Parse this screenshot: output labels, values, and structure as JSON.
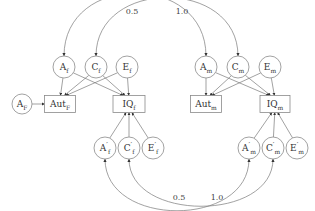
{
  "diagram": {
    "type": "path-diagram",
    "nodes": [
      {
        "id": "AF",
        "shape": "circle",
        "label": "A",
        "sub": "F",
        "prime": false
      },
      {
        "id": "AutF",
        "shape": "box",
        "label": "Aut",
        "sub": "F",
        "prime": false
      },
      {
        "id": "IQf",
        "shape": "box",
        "label": "IQ",
        "sub": "f",
        "prime": false
      },
      {
        "id": "Af",
        "shape": "circle",
        "label": "A",
        "sub": "f",
        "prime": false
      },
      {
        "id": "Cf",
        "shape": "circle",
        "label": "C",
        "sub": "f",
        "prime": false
      },
      {
        "id": "Ef",
        "shape": "circle",
        "label": "E",
        "sub": "f",
        "prime": false
      },
      {
        "id": "Am",
        "shape": "circle",
        "label": "A",
        "sub": "m",
        "prime": false
      },
      {
        "id": "Cm",
        "shape": "circle",
        "label": "C",
        "sub": "m",
        "prime": false
      },
      {
        "id": "Em",
        "shape": "circle",
        "label": "E",
        "sub": "m",
        "prime": false
      },
      {
        "id": "Autm",
        "shape": "box",
        "label": "Aut",
        "sub": "m",
        "prime": false
      },
      {
        "id": "IQm",
        "shape": "box",
        "label": "IQ",
        "sub": "m",
        "prime": false
      },
      {
        "id": "Apf",
        "shape": "circle",
        "label": "A",
        "sub": "f",
        "prime": true
      },
      {
        "id": "Cpf",
        "shape": "circle",
        "label": "C",
        "sub": "f",
        "prime": true
      },
      {
        "id": "Epf",
        "shape": "circle",
        "label": "E",
        "sub": "f",
        "prime": true
      },
      {
        "id": "Apm",
        "shape": "circle",
        "label": "A",
        "sub": "m",
        "prime": true
      },
      {
        "id": "Cpm",
        "shape": "circle",
        "label": "C",
        "sub": "m",
        "prime": true
      },
      {
        "id": "Epm",
        "shape": "circle",
        "label": "E",
        "sub": "m",
        "prime": true
      }
    ],
    "edges": [
      {
        "from": "AF",
        "to": "AutF"
      },
      {
        "from": "Af",
        "to": "AutF"
      },
      {
        "from": "Cf",
        "to": "AutF"
      },
      {
        "from": "Ef",
        "to": "AutF"
      },
      {
        "from": "Af",
        "to": "IQf"
      },
      {
        "from": "Cf",
        "to": "IQf"
      },
      {
        "from": "Ef",
        "to": "IQf"
      },
      {
        "from": "Am",
        "to": "Autm"
      },
      {
        "from": "Cm",
        "to": "Autm"
      },
      {
        "from": "Em",
        "to": "Autm"
      },
      {
        "from": "Am",
        "to": "IQm"
      },
      {
        "from": "Cm",
        "to": "IQm"
      },
      {
        "from": "Em",
        "to": "IQm"
      },
      {
        "from": "Apf",
        "to": "IQf"
      },
      {
        "from": "Cpf",
        "to": "IQf"
      },
      {
        "from": "Epf",
        "to": "IQf"
      },
      {
        "from": "Apm",
        "to": "IQm"
      },
      {
        "from": "Cpm",
        "to": "IQm"
      },
      {
        "from": "Epm",
        "to": "IQm"
      }
    ],
    "correlations": [
      {
        "between": [
          "Af",
          "Am"
        ],
        "value": "0.5",
        "side": "top"
      },
      {
        "between": [
          "Cf",
          "Cm"
        ],
        "value": "1.0",
        "side": "top"
      },
      {
        "between": [
          "Apf",
          "Apm"
        ],
        "value": "0.5",
        "side": "bottom"
      },
      {
        "between": [
          "Cpf",
          "Cpm"
        ],
        "value": "1.0",
        "side": "bottom"
      }
    ]
  }
}
